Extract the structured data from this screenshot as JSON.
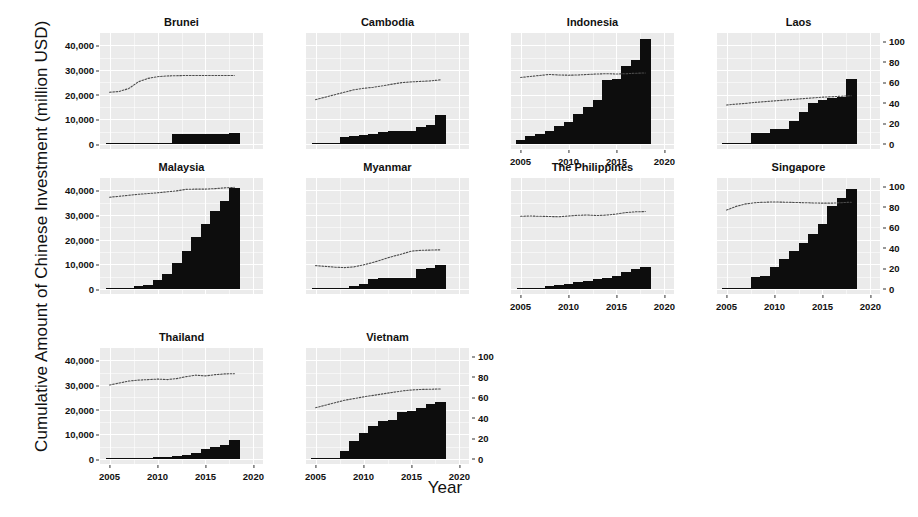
{
  "figure": {
    "ylabel": "Cumulative Amount of Chinese Investment (million USD)",
    "xlabel": "Year"
  },
  "chart_data": {
    "type": "bar",
    "title": "",
    "xlabel": "Year",
    "ylabel": "Cumulative Amount of Chinese Investment (million USD)",
    "secondary_ylabel": "",
    "xlim": [
      2004.0,
      2021.0
    ],
    "ylim": [
      -2000,
      45000
    ],
    "secondary_ylim": [
      -5,
      108
    ],
    "xticks": [
      2005,
      2010,
      2015,
      2020
    ],
    "yticks": [
      0,
      10000,
      20000,
      30000,
      40000
    ],
    "secondary_yticks": [
      0,
      20,
      40,
      60,
      80,
      100
    ],
    "grid": true,
    "legend": "none",
    "panels": [
      {
        "name": "Brunei",
        "row": 0,
        "col": 0,
        "left_axis": true,
        "right_axis": false,
        "bottom_axis": false,
        "bars": {
          "x": [
            2012,
            2013,
            2014,
            2015,
            2016,
            2017,
            2018
          ],
          "values": [
            3900,
            4000,
            4050,
            4100,
            4150,
            4200,
            4300
          ]
        },
        "line": {
          "x": [
            2005,
            2006,
            2007,
            2008,
            2009,
            2010,
            2011,
            2012,
            2013,
            2014,
            2015,
            2016,
            2017,
            2018
          ],
          "values": [
            21000,
            21300,
            22500,
            25200,
            26600,
            27300,
            27600,
            27700,
            27800,
            27800,
            27800,
            27800,
            27800,
            27800
          ]
        }
      },
      {
        "name": "Cambodia",
        "row": 0,
        "col": 1,
        "left_axis": false,
        "right_axis": false,
        "bottom_axis": false,
        "bars": {
          "x": [
            2008,
            2009,
            2010,
            2011,
            2012,
            2013,
            2014,
            2015,
            2016,
            2017,
            2018
          ],
          "values": [
            3000,
            3200,
            3600,
            4200,
            5000,
            5200,
            5300,
            5400,
            6800,
            7600,
            11800
          ]
        },
        "line": {
          "x": [
            2005,
            2006,
            2007,
            2008,
            2009,
            2010,
            2011,
            2012,
            2013,
            2014,
            2015,
            2016,
            2017,
            2018
          ],
          "values": [
            18000,
            19000,
            20000,
            21000,
            22000,
            22600,
            23000,
            23600,
            24300,
            24900,
            25200,
            25400,
            25600,
            26000
          ]
        }
      },
      {
        "name": "Indonesia",
        "row": 0,
        "col": 2,
        "left_axis": false,
        "right_axis": false,
        "bottom_axis": true,
        "bars": {
          "x": [
            2005,
            2006,
            2007,
            2008,
            2009,
            2010,
            2011,
            2012,
            2013,
            2014,
            2015,
            2016,
            2017,
            2018
          ],
          "values": [
            1500,
            3100,
            4200,
            5200,
            7500,
            8800,
            12000,
            15000,
            18000,
            26000,
            26500,
            31500,
            34000,
            42500
          ]
        },
        "line": {
          "x": [
            2005,
            2006,
            2007,
            2008,
            2009,
            2010,
            2011,
            2012,
            2013,
            2014,
            2015,
            2016,
            2017,
            2018
          ],
          "values": [
            27000,
            27400,
            27800,
            28200,
            28000,
            27900,
            28000,
            28200,
            28400,
            28500,
            28400,
            28500,
            28700,
            28800
          ]
        }
      },
      {
        "name": "Laos",
        "row": 0,
        "col": 3,
        "left_axis": false,
        "right_axis": true,
        "bottom_axis": false,
        "bars": {
          "x": [
            2005,
            2006,
            2007,
            2008,
            2009,
            2010,
            2011,
            2012,
            2013,
            2014,
            2015,
            2016,
            2017,
            2018
          ],
          "values": [
            100,
            150,
            200,
            4300,
            4500,
            6000,
            6200,
            9500,
            13000,
            16500,
            18000,
            18500,
            19000,
            26500
          ]
        },
        "line": {
          "x": [
            2005,
            2006,
            2007,
            2008,
            2009,
            2010,
            2011,
            2012,
            2013,
            2014,
            2015,
            2016,
            2017,
            2018
          ],
          "values": [
            15800,
            16200,
            16500,
            16900,
            17200,
            17500,
            17800,
            18100,
            18400,
            18700,
            19000,
            19200,
            19400,
            19600
          ]
        }
      },
      {
        "name": "Malaysia",
        "row": 1,
        "col": 0,
        "left_axis": true,
        "right_axis": false,
        "bottom_axis": false,
        "bars": {
          "x": [
            2008,
            2009,
            2010,
            2011,
            2012,
            2013,
            2014,
            2015,
            2016,
            2017,
            2018
          ],
          "values": [
            1300,
            1500,
            3500,
            6200,
            10500,
            15500,
            21000,
            26500,
            31500,
            35500,
            41000
          ]
        },
        "line": {
          "x": [
            2005,
            2006,
            2007,
            2008,
            2009,
            2010,
            2011,
            2012,
            2013,
            2014,
            2015,
            2016,
            2017,
            2018
          ],
          "values": [
            37200,
            37600,
            38000,
            38400,
            38700,
            39000,
            39400,
            39800,
            40400,
            40500,
            40500,
            40700,
            41000,
            41200
          ]
        }
      },
      {
        "name": "Myanmar",
        "row": 1,
        "col": 1,
        "left_axis": false,
        "right_axis": false,
        "bottom_axis": false,
        "bars": {
          "x": [
            2008,
            2009,
            2010,
            2011,
            2012,
            2013,
            2014,
            2015,
            2016,
            2017,
            2018
          ],
          "values": [
            500,
            1400,
            2200,
            4100,
            4300,
            4400,
            4500,
            4600,
            8200,
            8400,
            9700
          ]
        },
        "line": {
          "x": [
            2005,
            2006,
            2007,
            2008,
            2009,
            2010,
            2011,
            2012,
            2013,
            2014,
            2015,
            2016,
            2017,
            2018
          ],
          "values": [
            9500,
            9200,
            8900,
            8700,
            9000,
            9800,
            10800,
            12000,
            13200,
            14200,
            15400,
            15700,
            15800,
            15900
          ]
        }
      },
      {
        "name": "The Philippines",
        "row": 1,
        "col": 2,
        "left_axis": false,
        "right_axis": false,
        "bottom_axis": true,
        "bars": {
          "x": [
            2008,
            2009,
            2010,
            2011,
            2012,
            2013,
            2014,
            2015,
            2016,
            2017,
            2018
          ],
          "values": [
            1200,
            1500,
            2200,
            2700,
            3400,
            4000,
            4600,
            5200,
            6800,
            8000,
            9000
          ]
        },
        "line": {
          "x": [
            2005,
            2006,
            2007,
            2008,
            2009,
            2010,
            2011,
            2012,
            2013,
            2014,
            2015,
            2016,
            2017,
            2018
          ],
          "values": [
            29500,
            29600,
            29500,
            29400,
            29300,
            29600,
            29900,
            30000,
            29800,
            30000,
            30400,
            31000,
            31300,
            31400
          ]
        }
      },
      {
        "name": "Singapore",
        "row": 1,
        "col": 3,
        "left_axis": false,
        "right_axis": true,
        "bottom_axis": true,
        "bars": {
          "x": [
            2005,
            2006,
            2007,
            2008,
            2009,
            2010,
            2011,
            2012,
            2013,
            2014,
            2015,
            2016,
            2017,
            2018
          ],
          "values": [
            300,
            400,
            500,
            5000,
            5500,
            9000,
            12000,
            15500,
            18500,
            22500,
            26500,
            33500,
            37000,
            40500
          ]
        },
        "line": {
          "x": [
            2005,
            2006,
            2007,
            2008,
            2009,
            2010,
            2011,
            2012,
            2013,
            2014,
            2015,
            2016,
            2017,
            2018
          ],
          "values": [
            32000,
            33500,
            34500,
            35000,
            35200,
            35300,
            35200,
            35100,
            35000,
            34900,
            34800,
            34800,
            35000,
            35200
          ]
        }
      },
      {
        "name": "Thailand",
        "row": 2,
        "col": 0,
        "left_axis": true,
        "right_axis": false,
        "bottom_axis": true,
        "bars": {
          "x": [
            2009,
            2010,
            2011,
            2012,
            2013,
            2014,
            2015,
            2016,
            2017,
            2018
          ],
          "values": [
            500,
            700,
            900,
            1300,
            1800,
            2400,
            3900,
            5000,
            5600,
            7600
          ]
        },
        "line": {
          "x": [
            2005,
            2006,
            2007,
            2008,
            2009,
            2010,
            2011,
            2012,
            2013,
            2014,
            2015,
            2016,
            2017,
            2018
          ],
          "values": [
            30000,
            30800,
            31600,
            32000,
            32200,
            32400,
            32200,
            32600,
            33400,
            34000,
            33700,
            34200,
            34500,
            34600
          ]
        }
      },
      {
        "name": "Vietnam",
        "row": 2,
        "col": 1,
        "left_axis": false,
        "right_axis": true,
        "bottom_axis": true,
        "bars": {
          "x": [
            2005,
            2006,
            2007,
            2008,
            2009,
            2010,
            2011,
            2012,
            2013,
            2014,
            2015,
            2016,
            2017,
            2018
          ],
          "values": [
            300,
            400,
            500,
            3200,
            7500,
            10500,
            13500,
            15500,
            16000,
            19000,
            19500,
            20500,
            22500,
            23200
          ]
        },
        "line": {
          "x": [
            2005,
            2006,
            2007,
            2008,
            2009,
            2010,
            2011,
            2012,
            2013,
            2014,
            2015,
            2016,
            2017,
            2018
          ],
          "values": [
            20800,
            21800,
            22800,
            23800,
            24500,
            25200,
            25800,
            26400,
            27000,
            27600,
            28000,
            28200,
            28300,
            28400
          ]
        }
      }
    ]
  },
  "axes": {
    "left_tick_labels": [
      "0",
      "10,000",
      "20,000",
      "30,000",
      "40,000"
    ],
    "right_tick_labels": [
      "0",
      "20",
      "40",
      "60",
      "80",
      "100"
    ],
    "x_tick_labels": [
      "2005",
      "2010",
      "2015",
      "2020"
    ]
  },
  "colors": {
    "panel_background": "#ebebeb",
    "gridline": "#ffffff",
    "bar": "#0d0d0d",
    "line": "#4d4d4d",
    "text": "#111111"
  }
}
